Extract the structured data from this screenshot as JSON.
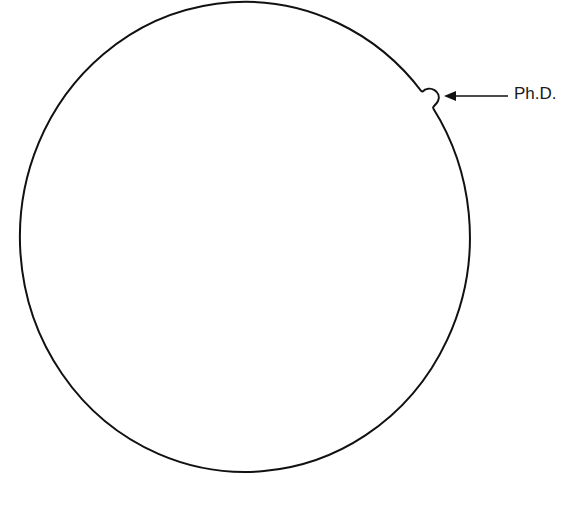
{
  "diagram": {
    "circle_label": "",
    "annotation": {
      "text": "Ph.D.",
      "points_to": "bump"
    },
    "colors": {
      "stroke": "#111111",
      "background": "#ffffff"
    }
  }
}
